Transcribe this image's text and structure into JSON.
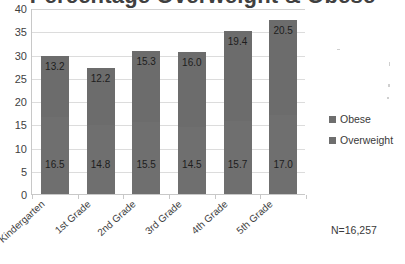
{
  "chart_data": {
    "type": "bar",
    "subtype": "stacked-column",
    "title": "Percentage Overweight & Obese",
    "title_cropped": true,
    "xlabel": "",
    "ylabel": "",
    "ylim": [
      0,
      40
    ],
    "ytick_step": 5,
    "yticks": [
      "40",
      "35",
      "30",
      "25",
      "20",
      "15",
      "10",
      "5",
      "0"
    ],
    "grid": "horizontal",
    "legend_position": "right",
    "categories": [
      "Kindergarten",
      "1st Grade",
      "2nd Grade",
      "3rd Grade",
      "4th Grade",
      "5th Grade"
    ],
    "series": [
      {
        "name": "Overweight",
        "stack_position": "bottom",
        "color": "#6f6f6f",
        "values": [
          16.5,
          14.8,
          15.5,
          14.5,
          15.7,
          17.0
        ],
        "labels": [
          "16.5",
          "14.8",
          "15.5",
          "14.5",
          "15.7",
          "17.0"
        ]
      },
      {
        "name": "Obese",
        "stack_position": "top",
        "color": "#6c6c6c",
        "values": [
          13.2,
          12.2,
          15.3,
          16.0,
          19.4,
          20.5
        ],
        "labels": [
          "13.2",
          "12.2",
          "15.3",
          "16.0",
          "19.4",
          "20.5"
        ]
      }
    ],
    "totals": [
      29.7,
      27.0,
      30.8,
      30.5,
      35.1,
      37.5
    ],
    "annotation": "N=16,257",
    "legend_order": [
      "Obese",
      "Overweight"
    ]
  },
  "legend": {
    "entries": [
      {
        "label": "Obese",
        "color": "#6e6e6e"
      },
      {
        "label": "Overweight",
        "color": "#6e6e6e"
      }
    ]
  },
  "footnote": {
    "sample_size": "N=16,257"
  },
  "colors": {
    "bar": "#6e6e6e",
    "axis": "#c8c8c8",
    "grid": "#dcdcdc",
    "text": "#3a3a3a",
    "background": "#ffffff"
  }
}
